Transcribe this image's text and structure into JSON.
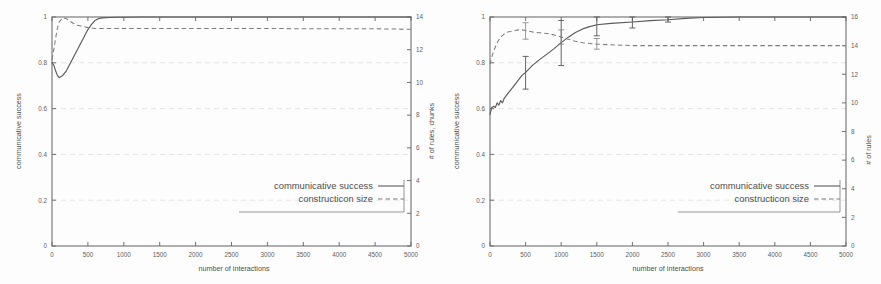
{
  "figure": {
    "background_color": "#fdfdfd",
    "axis_color": "#6f6f6f",
    "solid_series_color": "#5a5a5a",
    "dashed_series_color": "#7d7d7d",
    "grid_color": "#d9d9d9"
  },
  "panels": [
    {
      "id": "left",
      "xlabel": "number of interactions",
      "ylabel_left": "communicative success",
      "ylabel_right": "# of rules, chunks",
      "legend": [
        {
          "label": "communicative success",
          "style": "solid"
        },
        {
          "label": "constructicon size",
          "style": "dashed"
        }
      ],
      "xticks": [
        "0",
        "500",
        "1000",
        "1500",
        "2000",
        "2500",
        "3000",
        "3500",
        "4000",
        "4500",
        "5000"
      ],
      "yticks_left": [
        "0",
        "0.2",
        "0.4",
        "0.6",
        "0.8",
        "1"
      ],
      "yticks_right": [
        "0",
        "2",
        "4",
        "6",
        "8",
        "10",
        "12",
        "14"
      ]
    },
    {
      "id": "right",
      "xlabel": "number of interactions",
      "ylabel_left": "communicative success",
      "ylabel_right": "# of rules",
      "legend": [
        {
          "label": "communicative success",
          "style": "solid"
        },
        {
          "label": "constructicon size",
          "style": "dashed"
        }
      ],
      "xticks": [
        "0",
        "500",
        "1000",
        "1500",
        "2000",
        "2500",
        "3000",
        "3500",
        "4000",
        "4500",
        "5000"
      ],
      "yticks_left": [
        "0",
        "0.2",
        "0.4",
        "0.6",
        "0.8",
        "1"
      ],
      "yticks_right": [
        "0",
        "2",
        "4",
        "6",
        "8",
        "10",
        "12",
        "14",
        "16"
      ]
    }
  ],
  "chart_data": [
    {
      "type": "line",
      "panel": "left",
      "title": "",
      "xlabel": "number of interactions",
      "ylabel": "communicative success",
      "ylabel_secondary": "# of rules, chunks",
      "xlim": [
        0,
        5000
      ],
      "ylim": [
        0,
        1
      ],
      "ylim_secondary": [
        0,
        14
      ],
      "grid": true,
      "legend_position": "lower-right",
      "xticks": [
        0,
        500,
        1000,
        1500,
        2000,
        2500,
        3000,
        3500,
        4000,
        4500,
        5000
      ],
      "yticks": [
        0,
        0.2,
        0.4,
        0.6,
        0.8,
        1
      ],
      "yticks_secondary": [
        0,
        2,
        4,
        6,
        8,
        10,
        12,
        14
      ],
      "series": [
        {
          "name": "communicative success",
          "style": "solid",
          "axis": "left",
          "x": [
            0,
            25,
            50,
            75,
            100,
            125,
            150,
            200,
            250,
            300,
            350,
            400,
            450,
            500,
            550,
            600,
            650,
            700,
            800,
            900,
            1000,
            1250,
            1500,
            2000,
            2500,
            3000,
            3500,
            4000,
            4500,
            5000
          ],
          "y": [
            0.8,
            0.79,
            0.765,
            0.745,
            0.735,
            0.74,
            0.745,
            0.765,
            0.795,
            0.825,
            0.855,
            0.885,
            0.915,
            0.945,
            0.968,
            0.985,
            0.993,
            0.996,
            0.998,
            0.999,
            0.999,
            1.0,
            1.0,
            1.0,
            1.0,
            1.0,
            1.0,
            1.0,
            1.0,
            1.0
          ]
        },
        {
          "name": "constructicon size",
          "style": "dashed",
          "axis": "right",
          "x": [
            0,
            25,
            50,
            75,
            100,
            150,
            200,
            250,
            300,
            350,
            400,
            450,
            500,
            600,
            700,
            800,
            1000,
            1500,
            2000,
            2500,
            3000,
            3500,
            4000,
            4500,
            5000
          ],
          "y": [
            11.4,
            12.0,
            12.7,
            13.3,
            13.7,
            13.95,
            13.9,
            13.75,
            13.6,
            13.5,
            13.45,
            13.4,
            13.35,
            13.3,
            13.3,
            13.3,
            13.3,
            13.3,
            13.3,
            13.3,
            13.3,
            13.28,
            13.28,
            13.28,
            13.25
          ]
        }
      ]
    },
    {
      "type": "line",
      "panel": "right",
      "title": "",
      "xlabel": "number of interactions",
      "ylabel": "communicative success",
      "ylabel_secondary": "# of rules",
      "xlim": [
        0,
        5000
      ],
      "ylim": [
        0,
        1
      ],
      "ylim_secondary": [
        0,
        16
      ],
      "grid": true,
      "legend_position": "lower-right",
      "xticks": [
        0,
        500,
        1000,
        1500,
        2000,
        2500,
        3000,
        3500,
        4000,
        4500,
        5000
      ],
      "yticks": [
        0,
        0.2,
        0.4,
        0.6,
        0.8,
        1
      ],
      "yticks_secondary": [
        0,
        2,
        4,
        6,
        8,
        10,
        12,
        14,
        16
      ],
      "series": [
        {
          "name": "communicative success",
          "style": "solid",
          "axis": "left",
          "x": [
            0,
            25,
            50,
            75,
            100,
            125,
            150,
            175,
            200,
            250,
            300,
            350,
            400,
            450,
            500,
            600,
            700,
            800,
            900,
            1000,
            1100,
            1200,
            1300,
            1400,
            1500,
            1700,
            2000,
            2250,
            2500,
            2750,
            3000,
            3500,
            4000,
            4500,
            5000
          ],
          "y": [
            0.575,
            0.605,
            0.61,
            0.605,
            0.625,
            0.615,
            0.635,
            0.625,
            0.645,
            0.665,
            0.685,
            0.705,
            0.725,
            0.745,
            0.758,
            0.79,
            0.815,
            0.838,
            0.862,
            0.888,
            0.912,
            0.932,
            0.948,
            0.958,
            0.966,
            0.972,
            0.978,
            0.984,
            0.988,
            0.994,
            0.998,
            1.0,
            1.0,
            1.0,
            1.0
          ]
        },
        {
          "name": "constructicon size",
          "style": "dashed",
          "axis": "right",
          "x": [
            0,
            25,
            50,
            75,
            100,
            150,
            200,
            250,
            300,
            350,
            400,
            450,
            500,
            600,
            700,
            800,
            900,
            1000,
            1100,
            1200,
            1300,
            1500,
            1750,
            2000,
            2500,
            3000,
            3500,
            4000,
            4500,
            5000
          ],
          "y": [
            12.7,
            13.2,
            13.6,
            13.9,
            14.2,
            14.6,
            14.8,
            14.95,
            15.0,
            15.05,
            15.1,
            15.1,
            15.05,
            14.95,
            14.9,
            14.85,
            14.75,
            14.6,
            14.45,
            14.3,
            14.2,
            14.1,
            14.05,
            14.0,
            14.0,
            14.0,
            14.0,
            14.0,
            14.0,
            14.0
          ]
        }
      ],
      "error_bars": [
        {
          "series": "communicative success",
          "x": 500,
          "y": 0.758,
          "low": 0.685,
          "high": 0.828
        },
        {
          "series": "communicative success",
          "x": 1000,
          "y": 0.888,
          "low": 0.788,
          "high": 0.985
        },
        {
          "series": "communicative success",
          "x": 1500,
          "y": 0.966,
          "low": 0.918,
          "high": 1.0
        },
        {
          "series": "communicative success",
          "x": 2000,
          "y": 0.978,
          "low": 0.952,
          "high": 1.0
        },
        {
          "series": "communicative success",
          "x": 2500,
          "y": 0.988,
          "low": 0.978,
          "high": 1.0
        },
        {
          "series": "constructicon size",
          "x": 500,
          "y": 15.05,
          "low": 14.45,
          "high": 15.6
        },
        {
          "series": "constructicon size",
          "x": 1000,
          "y": 14.6,
          "low": 14.1,
          "high": 15.1
        },
        {
          "series": "constructicon size",
          "x": 1500,
          "y": 14.1,
          "low": 13.75,
          "high": 14.5
        }
      ]
    }
  ]
}
